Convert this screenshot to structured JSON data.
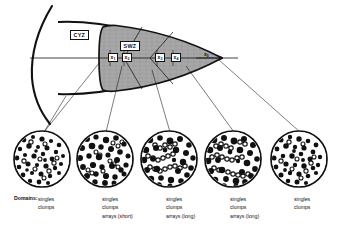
{
  "figure": {
    "background_color": "#ffffff",
    "ink_color": "#111111",
    "shaded_zone_color": "#a8a8a8"
  },
  "diagram": {
    "zone_labels": [
      {
        "id": "cyz",
        "text": "CYZ",
        "x": 70,
        "y": 30
      },
      {
        "id": "swz",
        "text": "SWZ",
        "x": 120,
        "y": 41
      }
    ],
    "axis": {
      "orientation": "horizontal",
      "y": 58,
      "x_start": 30,
      "x_end": 222
    },
    "x_ticks": [
      {
        "id": "x1",
        "base": "x",
        "sub": "1",
        "boxed": true,
        "x": 108,
        "y": 53
      },
      {
        "id": "x2",
        "base": "x",
        "sub": "2",
        "boxed": true,
        "x": 122,
        "y": 53
      },
      {
        "id": "x3",
        "base": "x",
        "sub": "3",
        "boxed": true,
        "x": 155,
        "y": 53
      },
      {
        "id": "x4",
        "base": "x",
        "sub": "4",
        "boxed": true,
        "x": 171,
        "y": 53
      },
      {
        "id": "x5",
        "base": "x",
        "sub": "5",
        "boxed": false,
        "x": 202,
        "y": 53
      }
    ]
  },
  "micrographs": {
    "count": 5,
    "circles": [
      {
        "id": "circle-1",
        "cx": 42,
        "cy": 159,
        "r": 28,
        "density": "high",
        "has_arrays": false
      },
      {
        "id": "circle-2",
        "cx": 105,
        "cy": 159,
        "r": 28,
        "density": "high",
        "has_arrays": true
      },
      {
        "id": "circle-3",
        "cx": 169,
        "cy": 159,
        "r": 28,
        "density": "medium",
        "has_arrays": true
      },
      {
        "id": "circle-4",
        "cx": 233,
        "cy": 159,
        "r": 28,
        "density": "medium",
        "has_arrays": true
      },
      {
        "id": "circle-5",
        "cx": 299,
        "cy": 159,
        "r": 28,
        "density": "high",
        "has_arrays": false
      }
    ]
  },
  "legend": {
    "caption": "Domains:",
    "caption_x": 14,
    "caption_y": 196,
    "columns": [
      {
        "id": "col-1",
        "x": 38,
        "y": 196,
        "lines": [
          "singles",
          "clumps"
        ]
      },
      {
        "id": "col-2",
        "x": 102,
        "y": 196,
        "lines": [
          "singles",
          "clumps",
          "arrays (short)"
        ]
      },
      {
        "id": "col-3",
        "x": 166,
        "y": 196,
        "lines": [
          "singles",
          "clumps",
          "arrays (long)"
        ]
      },
      {
        "id": "col-4",
        "x": 230,
        "y": 196,
        "lines": [
          "singles",
          "clumps",
          "arrays (long)"
        ]
      },
      {
        "id": "col-5",
        "x": 294,
        "y": 196,
        "lines": [
          "singles",
          "clumps"
        ]
      }
    ]
  }
}
